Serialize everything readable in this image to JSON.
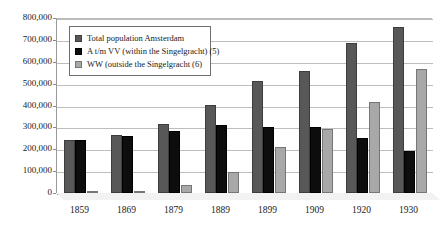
{
  "chart_data": {
    "type": "bar",
    "title": "",
    "xlabel": "",
    "ylabel": "",
    "categories": [
      "1859",
      "1869",
      "1879",
      "1889",
      "1899",
      "1909",
      "1920",
      "1930"
    ],
    "ylim": [
      0,
      800000
    ],
    "ytick_labels": [
      "800,000",
      "700,000",
      "600,000",
      "500,000",
      "400,000",
      "300,000",
      "200,000",
      "100,000",
      "0"
    ],
    "ytick_values": [
      800000,
      700000,
      600000,
      500000,
      400000,
      300000,
      200000,
      100000,
      0
    ],
    "grid": true,
    "legend_position": "top-left",
    "series": [
      {
        "name": "Total population Amsterdam",
        "color": "#585858",
        "values": [
          243000,
          265000,
          317000,
          403000,
          510000,
          557000,
          685000,
          757000
        ]
      },
      {
        "name": "A t/m VV (within the Singelgracht) (5)",
        "color": "#0d0d0d",
        "values": [
          241000,
          262000,
          285000,
          310000,
          300000,
          300000,
          253000,
          190000
        ]
      },
      {
        "name": "WW (outside the Singelgracht (6)",
        "color": "#a8a8a8",
        "values": [
          5000,
          8000,
          37000,
          98000,
          209000,
          294000,
          418000,
          567000
        ]
      }
    ]
  }
}
